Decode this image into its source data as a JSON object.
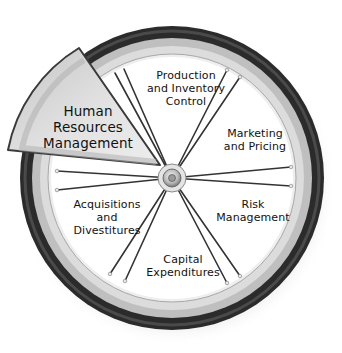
{
  "diagram": {
    "type": "wheel",
    "center": {
      "x": 172,
      "y": 178
    },
    "colors": {
      "tire": "#2a2a2a",
      "rim": "#c8c8c8",
      "rim_inner": "#e6e6e6",
      "wheel_face": "#ffffff",
      "spoke": "#333333",
      "highlight_wedge_fill": "#d9d9d9",
      "highlight_wedge_stroke": "#3a3a3a"
    },
    "highlighted_segment": {
      "lines": [
        "Human",
        "Resources",
        "Management"
      ]
    },
    "segments": [
      {
        "id": "production",
        "lines": [
          "Production",
          "and Inventory",
          "Control"
        ]
      },
      {
        "id": "marketing",
        "lines": [
          "Marketing",
          "and Pricing"
        ]
      },
      {
        "id": "risk",
        "lines": [
          "Risk",
          "Management"
        ]
      },
      {
        "id": "capital",
        "lines": [
          "Capital",
          "Expenditures"
        ]
      },
      {
        "id": "acquisitions",
        "lines": [
          "Acquisitions",
          "and",
          "Divestitures"
        ]
      }
    ]
  }
}
